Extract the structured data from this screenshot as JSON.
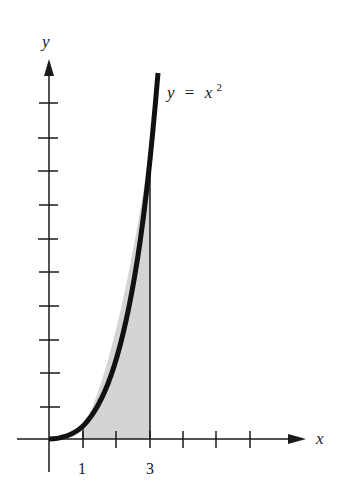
{
  "figure": {
    "function_label": {
      "lhs": "y",
      "eq": "=",
      "base": "x",
      "exp": "2"
    },
    "x_axis": {
      "label": "x",
      "tick_labels": [
        {
          "value": "1",
          "tick_index": 1
        },
        {
          "value": "3",
          "tick_index": 3
        }
      ],
      "tick_count": 6
    },
    "y_axis": {
      "label": "y",
      "tick_count": 10
    },
    "shaded_region": {
      "from": 1,
      "to": 3,
      "fill": "#d4d4d4"
    },
    "colors": {
      "ink": "#1a1a1a",
      "shade": "#d4d4d4",
      "background": "#ffffff"
    }
  }
}
